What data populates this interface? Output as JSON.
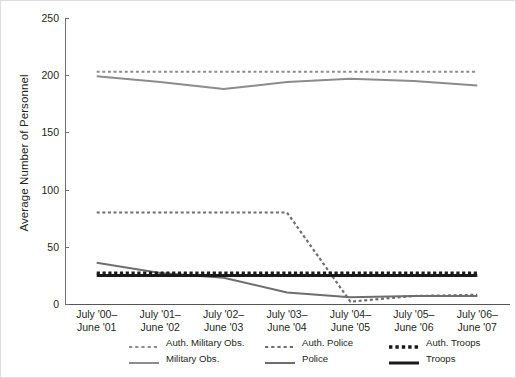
{
  "chart_data": {
    "type": "line",
    "title": "",
    "xlabel": "",
    "ylabel": "Average Number of Personnel",
    "ylim": [
      0,
      250
    ],
    "yticks": [
      0,
      50,
      100,
      150,
      200,
      250
    ],
    "grid": false,
    "legend_position": "bottom",
    "categories": [
      "July '00–\nJune '01",
      "July '01–\nJune '02",
      "July '02–\nJune '03",
      "July '03–\nJune '04",
      "July '04–\nJune '05",
      "July '05–\nJune '06",
      "July '06–\nJune '07"
    ],
    "categories_line1": [
      "July '00–",
      "July '01–",
      "July '02–",
      "July '03–",
      "July '04–",
      "July '05–",
      "July '06–"
    ],
    "categories_line2": [
      "June '01",
      "June '02",
      "June '03",
      "June '04",
      "June '05",
      "June '06",
      "June '07"
    ],
    "series": [
      {
        "name": "Auth. Military Obs.",
        "style": "dashed",
        "color": "#8c8c8c",
        "width": 2.2,
        "values": [
          203,
          203,
          203,
          203,
          203,
          203,
          203
        ]
      },
      {
        "name": "Military Obs.",
        "style": "solid",
        "color": "#8c8c8c",
        "width": 2.0,
        "values": [
          199,
          194,
          188,
          194,
          197,
          195,
          191
        ]
      },
      {
        "name": "Auth. Police",
        "style": "dashed",
        "color": "#6e6e6e",
        "width": 2.2,
        "values": [
          80,
          80,
          80,
          80,
          2,
          7,
          8
        ]
      },
      {
        "name": "Police",
        "style": "solid",
        "color": "#6e6e6e",
        "width": 2.0,
        "values": [
          36,
          27,
          23,
          10,
          6,
          7,
          7
        ]
      },
      {
        "name": "Auth. Troops",
        "style": "dashed",
        "color": "#1a1a1a",
        "width": 3.4,
        "values": [
          27,
          27,
          27,
          27,
          27,
          27,
          27
        ]
      },
      {
        "name": "Troops",
        "style": "solid",
        "color": "#1a1a1a",
        "width": 3.0,
        "values": [
          25,
          25,
          25,
          25,
          25,
          25,
          25
        ]
      }
    ]
  },
  "legend": {
    "row1": [
      "Auth. Military Obs.",
      "Auth. Police",
      "Auth. Troops"
    ],
    "row2": [
      "Military Obs.",
      "Police",
      "Troops"
    ]
  }
}
